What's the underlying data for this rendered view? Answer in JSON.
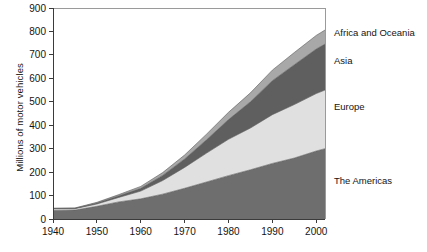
{
  "chart_data": {
    "type": "area",
    "stacked": true,
    "title": "",
    "subtitle": "",
    "xlabel": "",
    "ylabel": "Millions of motor vehicles",
    "xlim": [
      1940,
      2002
    ],
    "ylim": [
      0,
      900
    ],
    "xticks": [
      1940,
      1950,
      1960,
      1970,
      1980,
      1990,
      2000
    ],
    "yticks": [
      0,
      100,
      200,
      300,
      400,
      500,
      600,
      700,
      800,
      900
    ],
    "xtick_labels": [
      "1940",
      "1950",
      "1960",
      "1970",
      "1980",
      "1990",
      "2000"
    ],
    "ytick_labels": [
      "0",
      "100",
      "200",
      "300",
      "400",
      "500",
      "600",
      "700",
      "800",
      "900"
    ],
    "grid": false,
    "legend_position": "right-inline-labels",
    "x": [
      1940,
      1945,
      1950,
      1955,
      1960,
      1965,
      1970,
      1975,
      1980,
      1985,
      1990,
      1995,
      2000,
      2002
    ],
    "series": [
      {
        "name": "The Americas",
        "label": "The Americas",
        "color": "#6e6e6e",
        "values": [
          36,
          38,
          54,
          73,
          86,
          106,
          131,
          158,
          185,
          210,
          237,
          260,
          290,
          300
        ]
      },
      {
        "name": "Europe",
        "label": "Europe",
        "color": "#e0e0e0",
        "values": [
          7,
          6,
          10,
          19,
          33,
          58,
          89,
          123,
          155,
          178,
          208,
          228,
          245,
          250
        ]
      },
      {
        "name": "Asia",
        "label": "Asia",
        "color": "#5f5f5f",
        "values": [
          2,
          2,
          4,
          7,
          12,
          22,
          36,
          57,
          84,
          112,
          145,
          170,
          190,
          196
        ]
      },
      {
        "name": "Africa and Oceania",
        "label": "Africa and Oceania",
        "color": "#a8a8a8",
        "values": [
          1,
          1,
          3,
          5,
          8,
          12,
          17,
          24,
          31,
          38,
          45,
          52,
          58,
          60
        ]
      }
    ],
    "totals": [
      46,
      47,
      71,
      104,
      139,
      198,
      273,
      362,
      455,
      538,
      635,
      710,
      783,
      806
    ],
    "series_label_positions": [
      {
        "label": "Africa and Oceania",
        "y_value": 790
      },
      {
        "label": "Asia",
        "y_value": 672
      },
      {
        "label": "Europe",
        "y_value": 475
      },
      {
        "label": "The Americas",
        "y_value": 160
      }
    ]
  }
}
